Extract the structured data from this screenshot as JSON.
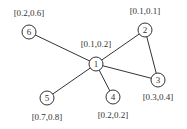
{
  "graph": {
    "nodes": [
      {
        "id": "1",
        "label": "[0.1,0.2]",
        "x": 96,
        "y": 64,
        "label_x": 96,
        "label_y": 47
      },
      {
        "id": "2",
        "label": "[0.1,0.1]",
        "x": 145,
        "y": 30,
        "label_x": 145,
        "label_y": 14
      },
      {
        "id": "3",
        "label": "[0.3,0.4]",
        "x": 158,
        "y": 80,
        "label_x": 158,
        "label_y": 100
      },
      {
        "id": "4",
        "label": "[0.2,0.2]",
        "x": 113,
        "y": 97,
        "label_x": 113,
        "label_y": 118
      },
      {
        "id": "5",
        "label": "[0.7,0.8]",
        "x": 47,
        "y": 98,
        "label_x": 47,
        "label_y": 120
      },
      {
        "id": "6",
        "label": "[0.2,0.6]",
        "x": 29,
        "y": 32,
        "label_x": 29,
        "label_y": 16
      }
    ],
    "edges": [
      {
        "from": "1",
        "to": "6"
      },
      {
        "from": "1",
        "to": "2"
      },
      {
        "from": "1",
        "to": "3"
      },
      {
        "from": "1",
        "to": "4"
      },
      {
        "from": "1",
        "to": "5"
      },
      {
        "from": "2",
        "to": "3"
      }
    ],
    "node_radius": 7,
    "stroke_color": "#333333"
  }
}
